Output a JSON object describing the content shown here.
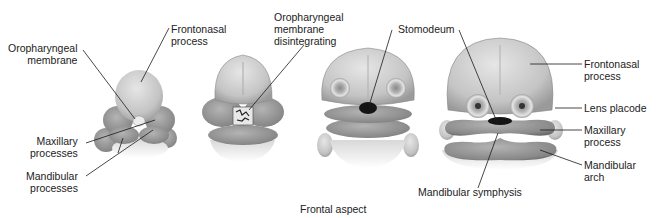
{
  "figure": {
    "caption": "Frontal aspect",
    "stages": [
      {
        "id": "stage-1",
        "labels": {
          "oropharyngeal_membrane": "Oropharyngeal\nmembrane",
          "frontonasal_process": "Frontonasal\nprocess",
          "maxillary_processes": "Maxillary\nprocesses",
          "mandibular_processes": "Mandibular\nprocesses"
        }
      },
      {
        "id": "stage-2",
        "labels": {
          "oropharyngeal_membrane_disintegrating": "Oropharyngeal\nmembrane\ndisintegrating"
        }
      },
      {
        "id": "stage-3",
        "labels": {
          "stomodeum": "Stomodeum"
        }
      },
      {
        "id": "stage-4",
        "labels": {
          "frontonasal_process": "Frontonasal\nprocess",
          "lens_placode": "Lens placode",
          "maxillary_process": "Maxillary\nprocess",
          "mandibular_arch": "Mandibular\narch",
          "mandibular_symphysis": "Mandibular symphysis"
        }
      }
    ]
  },
  "colors": {
    "background": "#ffffff",
    "text": "#222222",
    "leader_line": "#1a1a1a",
    "tissue_light": "#d4d4d4",
    "tissue_mid": "#a8a8a8",
    "tissue_dark": "#7e7e7e",
    "opening": "#151515"
  }
}
